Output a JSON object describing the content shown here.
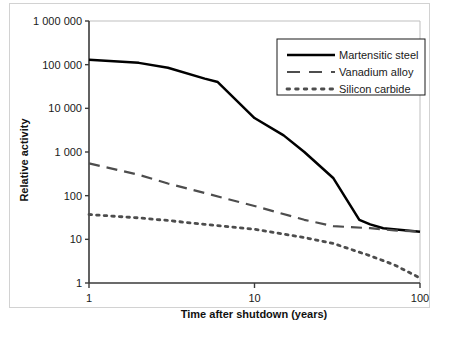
{
  "chart_data": {
    "type": "line",
    "title": "",
    "xlabel": "Time after shutdown (years)",
    "ylabel": "Relative activity",
    "xscale": "log",
    "yscale": "log",
    "xlim": [
      1,
      100
    ],
    "ylim": [
      1,
      1000000
    ],
    "grid": false,
    "legend_position": "top-right",
    "xticks": [
      1,
      10,
      100
    ],
    "xtick_labels": [
      "1",
      "10",
      "100"
    ],
    "yticks": [
      1,
      10,
      100,
      1000,
      10000,
      100000,
      1000000
    ],
    "ytick_labels": [
      "1",
      "10",
      "100",
      "1 000",
      "10 000",
      "100 000",
      "1 000 000"
    ],
    "series": [
      {
        "name": "Martensitic steel",
        "style": "solid",
        "color": "#000000",
        "x": [
          1,
          2,
          3,
          5,
          6,
          10,
          15,
          20,
          30,
          43,
          50,
          60,
          100
        ],
        "y": [
          130000,
          110000,
          85000,
          48000,
          40000,
          6000,
          2400,
          1000,
          250,
          28,
          22,
          18,
          15
        ]
      },
      {
        "name": "Vanadium alloy",
        "style": "dashed",
        "color": "#4d4d4d",
        "x": [
          1,
          2,
          3,
          5,
          10,
          20,
          30,
          50,
          70,
          100
        ],
        "y": [
          550,
          300,
          190,
          115,
          58,
          28,
          20,
          18,
          16,
          15
        ]
      },
      {
        "name": "Silicon carbide",
        "style": "dotted",
        "color": "#4d4d4d",
        "x": [
          1,
          2,
          3,
          5,
          10,
          20,
          30,
          50,
          70,
          100
        ],
        "y": [
          37,
          31,
          27,
          22,
          17,
          11,
          8,
          4.2,
          2.6,
          1.3
        ]
      }
    ]
  },
  "legend": {
    "items": [
      {
        "label": "Martensitic steel",
        "style": "solid"
      },
      {
        "label": "Vanadium alloy",
        "style": "dashed"
      },
      {
        "label": "Silicon carbide",
        "style": "dotted"
      }
    ]
  },
  "axes": {
    "x_title": "Time after shutdown (years)",
    "y_title": "Relative activity"
  }
}
